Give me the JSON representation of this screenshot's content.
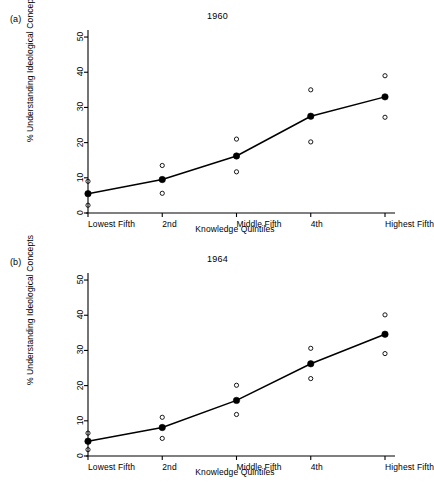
{
  "figure": {
    "background": "#ffffff",
    "ink_color": "#000000"
  },
  "panels": [
    {
      "key": "a",
      "panel_label": "(a)",
      "title": "1960"
    },
    {
      "key": "b",
      "panel_label": "(b)",
      "title": "1964"
    }
  ],
  "chart_data": [
    {
      "type": "line",
      "title": "1960",
      "panel_label": "(a)",
      "xlabel": "Knowledge Quintiles",
      "ylabel": "% Understanding Ideological Concepts",
      "categories": [
        "Lowest Fifth",
        "2nd",
        "Middle Fifth",
        "4th",
        "Highest Fifth"
      ],
      "ylim": [
        0,
        52
      ],
      "yticks": [
        0,
        10,
        20,
        30,
        40,
        50
      ],
      "ytick_labels": [
        "0",
        "10",
        "20",
        "30",
        "40",
        "50"
      ],
      "grid": false,
      "legend": null,
      "series": [
        {
          "name": "Mean (filled circles, connected)",
          "marker": "filled-circle",
          "values": [
            5.5,
            9.5,
            16.2,
            27.5,
            33.0
          ]
        },
        {
          "name": "Individual observations (open circles)",
          "marker": "open-circle",
          "points": [
            {
              "category": "Lowest Fifth",
              "values": [
                2.2,
                9.0
              ]
            },
            {
              "category": "2nd",
              "values": [
                5.6,
                13.5
              ]
            },
            {
              "category": "Middle Fifth",
              "values": [
                11.7,
                21.0
              ]
            },
            {
              "category": "4th",
              "values": [
                20.2,
                35.0
              ]
            },
            {
              "category": "Highest Fifth",
              "values": [
                27.2,
                39.0
              ]
            }
          ]
        }
      ]
    },
    {
      "type": "line",
      "title": "1964",
      "panel_label": "(b)",
      "xlabel": "Knowledge Quintiles",
      "ylabel": "% Understanding Ideological Concepts",
      "categories": [
        "Lowest Fifth",
        "2nd",
        "Middle Fifth",
        "4th",
        "Highest Fifth"
      ],
      "ylim": [
        0,
        52
      ],
      "yticks": [
        0,
        10,
        20,
        30,
        40,
        50
      ],
      "ytick_labels": [
        "0",
        "10",
        "20",
        "30",
        "40",
        "50"
      ],
      "grid": false,
      "legend": null,
      "series": [
        {
          "name": "Mean (filled circles, connected)",
          "marker": "filled-circle",
          "values": [
            4.2,
            8.1,
            15.8,
            26.2,
            34.6
          ]
        },
        {
          "name": "Individual observations (open circles)",
          "marker": "open-circle",
          "points": [
            {
              "category": "Lowest Fifth",
              "values": [
                1.8,
                6.5
              ]
            },
            {
              "category": "2nd",
              "values": [
                5.0,
                11.0
              ]
            },
            {
              "category": "Middle Fifth",
              "values": [
                11.8,
                20.1
              ]
            },
            {
              "category": "4th",
              "values": [
                22.0,
                30.6
              ]
            },
            {
              "category": "Highest Fifth",
              "values": [
                29.1,
                40.1
              ]
            }
          ]
        }
      ]
    }
  ]
}
